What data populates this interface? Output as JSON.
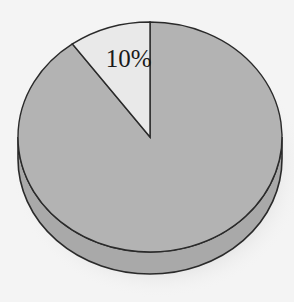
{
  "chart_data": {
    "type": "pie",
    "style": "3d",
    "title": "",
    "slices": [
      {
        "label": "10%",
        "value": 10,
        "color": "#e9e9e9",
        "show_label": true
      },
      {
        "label": "",
        "value": 90,
        "color": "#b3b3b3",
        "show_label": false
      }
    ],
    "start_angle_deg": 0,
    "direction": "counterclockwise",
    "legend": "none",
    "colors": {
      "background": "#f4f4f4",
      "outline": "#2a2a2a",
      "rim": "#a9a9a9",
      "shadow": "#c8c8c8"
    }
  }
}
